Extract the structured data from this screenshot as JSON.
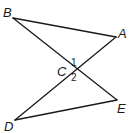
{
  "diagram": {
    "type": "geometry",
    "points": [
      {
        "id": "B",
        "label": "B",
        "x": 13,
        "y": 18,
        "lx": 3,
        "ly": 17
      },
      {
        "id": "A",
        "label": "A",
        "x": 116,
        "y": 37,
        "lx": 118,
        "ly": 38
      },
      {
        "id": "C",
        "label": "C",
        "x": 73,
        "y": 69,
        "lx": 57,
        "ly": 76
      },
      {
        "id": "E",
        "label": "E",
        "x": 117,
        "y": 100,
        "lx": 117,
        "ly": 113
      },
      {
        "id": "D",
        "label": "D",
        "x": 15,
        "y": 120,
        "lx": 4,
        "ly": 131
      }
    ],
    "segments": [
      {
        "from": "B",
        "to": "A"
      },
      {
        "from": "B",
        "to": "E"
      },
      {
        "from": "A",
        "to": "D"
      },
      {
        "from": "D",
        "to": "E"
      }
    ],
    "angles": [
      {
        "label": "1",
        "x": 71,
        "y": 66
      },
      {
        "label": "2",
        "x": 71,
        "y": 81
      }
    ]
  }
}
